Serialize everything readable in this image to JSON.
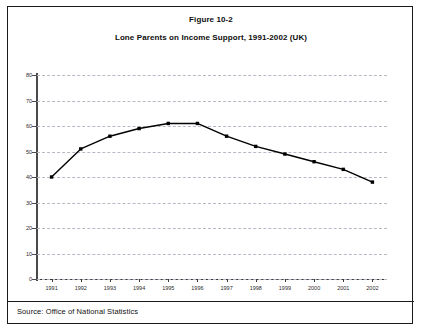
{
  "figure": {
    "number_label": "Figure 10-2",
    "title": "Lone Parents on Income Support, 1991-2002 (UK)",
    "source_note": "Source: Office of National Statistics"
  },
  "chart_data": {
    "type": "line",
    "title": "Lone Parents on Income Support, 1991-2002 (UK)",
    "subtitle": "Figure 10-2",
    "xlabel": "",
    "ylabel": "",
    "categories": [
      "1991",
      "1992",
      "1993",
      "1994",
      "1995",
      "1996",
      "1997",
      "1998",
      "1999",
      "2000",
      "2001",
      "2002"
    ],
    "values": [
      40,
      51,
      56,
      59,
      61,
      61,
      56,
      52,
      49,
      46,
      43,
      38
    ],
    "series": [
      {
        "name": "Lone Parents on Income Support",
        "values": [
          40,
          51,
          56,
          59,
          61,
          61,
          56,
          52,
          49,
          46,
          43,
          38
        ]
      }
    ],
    "ylim": [
      0,
      80
    ],
    "yticks": [
      0,
      10,
      20,
      30,
      40,
      50,
      60,
      70,
      80
    ],
    "ytick_labels": [
      "0",
      "10",
      "20",
      "30",
      "40",
      "50",
      "60",
      "70",
      "80"
    ],
    "xtick_labels": [
      "1991",
      "1992",
      "1993",
      "1994",
      "1995",
      "1996",
      "1997",
      "1998",
      "1999",
      "2000",
      "2001",
      "2002"
    ],
    "grid": true,
    "grid_style": "dashed-horizontal",
    "legend": false,
    "legend_position": "none",
    "marker": "square",
    "line_color": "#000000",
    "grid_color": "#b9b9c6",
    "axis_color": "#4a4a4a"
  }
}
